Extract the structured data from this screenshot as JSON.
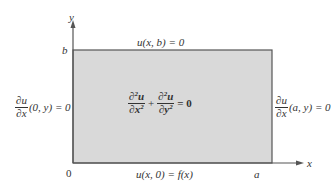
{
  "diagram": {
    "colors": {
      "fill": "#d9d9d9",
      "stroke": "#555555",
      "text": "#333333"
    },
    "axes": {
      "x_label": "x",
      "y_label": "y",
      "origin_label": "0",
      "a_label": "a",
      "b_label": "b"
    },
    "boundary_conditions": {
      "top": "u(x, b) = 0",
      "bottom": "u(x, 0) = f(x)",
      "left": {
        "num": "∂u",
        "den": "∂x",
        "rest": "(0, y) = 0"
      },
      "right": {
        "num": "∂u",
        "den": "∂x",
        "rest": "(a, y) = 0"
      }
    },
    "equation": {
      "term1_num": "∂²u",
      "term1_num_base": "∂",
      "term1_num_sup": "2",
      "term1_num_var": "u",
      "term1_den_var": "∂x",
      "term1_den_sup": "2",
      "plus": "+",
      "term2_num_base": "∂",
      "term2_num_sup": "2",
      "term2_num_var": "u",
      "term2_den_var": "∂y",
      "term2_den_sup": "2",
      "rhs": "= 0"
    }
  }
}
